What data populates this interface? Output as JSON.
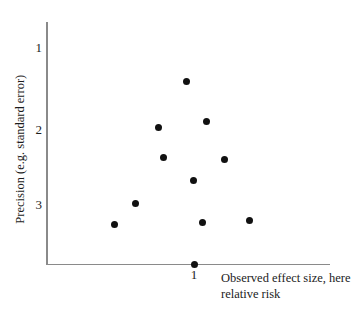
{
  "chart_data": {
    "type": "scatter",
    "title": "",
    "xlabel": "Observed effect size, here relative risk",
    "xlabel_line1": "Observed effect size, here",
    "xlabel_line2": "relative risk",
    "ylabel": "Precision (e.g. standard error)",
    "x_ticks": [
      {
        "label": "1",
        "value": 1,
        "px": 194
      }
    ],
    "y_ticks": [
      {
        "label": "1",
        "value": 1,
        "px": 48
      },
      {
        "label": "2",
        "value": 2,
        "px": 130
      },
      {
        "label": "3",
        "value": 3,
        "px": 205
      }
    ],
    "y_axis_inverted": true,
    "grid": false,
    "legend": null,
    "xlim": [
      0.55,
      1.75
    ],
    "ylim": [
      0.7,
      3.95
    ],
    "points": [
      {
        "x": 0.99,
        "y": 1.41,
        "px": 186,
        "py": 81
      },
      {
        "x": 0.83,
        "y": 2.0,
        "px": 158,
        "py": 127
      },
      {
        "x": 1.2,
        "y": 1.93,
        "px": 206,
        "py": 121
      },
      {
        "x": 0.87,
        "y": 2.36,
        "px": 163,
        "py": 157
      },
      {
        "x": 1.38,
        "y": 2.39,
        "px": 224,
        "py": 159
      },
      {
        "x": 1.08,
        "y": 2.66,
        "px": 193,
        "py": 180
      },
      {
        "x": 0.67,
        "y": 2.92,
        "px": 135,
        "py": 203
      },
      {
        "x": 1.18,
        "y": 3.17,
        "px": 202,
        "py": 222
      },
      {
        "x": 1.68,
        "y": 3.1,
        "px": 249,
        "py": 220
      },
      {
        "x": 0.5,
        "y": 3.25,
        "px": 114,
        "py": 224
      },
      {
        "x": 1.0,
        "y": 3.88,
        "px": 194,
        "py": 264
      }
    ],
    "marker_color": "#111111",
    "axis_color": "#8a8a8a",
    "background_color": "#ffffff"
  }
}
